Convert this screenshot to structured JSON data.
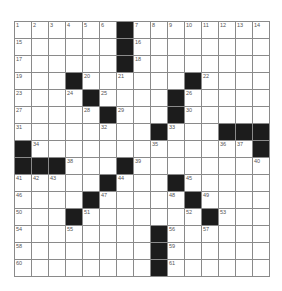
{
  "puzzle": {
    "rows": 15,
    "cols": 15,
    "colors": {
      "black": "#1c1c1c",
      "line": "#8a8a8a",
      "number": "#555555"
    },
    "blacks": [
      [
        0,
        6
      ],
      [
        1,
        6
      ],
      [
        2,
        6
      ],
      [
        3,
        3
      ],
      [
        3,
        10
      ],
      [
        4,
        4
      ],
      [
        4,
        9
      ],
      [
        5,
        5
      ],
      [
        5,
        9
      ],
      [
        6,
        8
      ],
      [
        6,
        12
      ],
      [
        6,
        13
      ],
      [
        6,
        14
      ],
      [
        7,
        0
      ],
      [
        7,
        14
      ],
      [
        8,
        0
      ],
      [
        8,
        1
      ],
      [
        8,
        2
      ],
      [
        8,
        6
      ],
      [
        9,
        5
      ],
      [
        9,
        9
      ],
      [
        10,
        4
      ],
      [
        10,
        10
      ],
      [
        11,
        3
      ],
      [
        11,
        11
      ],
      [
        12,
        8
      ],
      [
        13,
        8
      ],
      [
        14,
        8
      ]
    ],
    "numbers": [
      {
        "r": 0,
        "c": 0,
        "n": "1"
      },
      {
        "r": 0,
        "c": 1,
        "n": "2"
      },
      {
        "r": 0,
        "c": 2,
        "n": "3"
      },
      {
        "r": 0,
        "c": 3,
        "n": "4"
      },
      {
        "r": 0,
        "c": 4,
        "n": "5"
      },
      {
        "r": 0,
        "c": 5,
        "n": "6"
      },
      {
        "r": 0,
        "c": 7,
        "n": "7"
      },
      {
        "r": 0,
        "c": 8,
        "n": "8"
      },
      {
        "r": 0,
        "c": 9,
        "n": "9"
      },
      {
        "r": 0,
        "c": 10,
        "n": "10"
      },
      {
        "r": 0,
        "c": 11,
        "n": "11"
      },
      {
        "r": 0,
        "c": 12,
        "n": "12"
      },
      {
        "r": 0,
        "c": 13,
        "n": "13"
      },
      {
        "r": 0,
        "c": 14,
        "n": "14"
      },
      {
        "r": 1,
        "c": 0,
        "n": "15"
      },
      {
        "r": 1,
        "c": 7,
        "n": "16"
      },
      {
        "r": 2,
        "c": 0,
        "n": "17"
      },
      {
        "r": 2,
        "c": 7,
        "n": "18"
      },
      {
        "r": 3,
        "c": 0,
        "n": "19"
      },
      {
        "r": 3,
        "c": 4,
        "n": "20"
      },
      {
        "r": 3,
        "c": 6,
        "n": "21"
      },
      {
        "r": 3,
        "c": 11,
        "n": "22"
      },
      {
        "r": 4,
        "c": 0,
        "n": "23"
      },
      {
        "r": 4,
        "c": 3,
        "n": "24"
      },
      {
        "r": 4,
        "c": 5,
        "n": "25"
      },
      {
        "r": 4,
        "c": 10,
        "n": "26"
      },
      {
        "r": 5,
        "c": 0,
        "n": "27"
      },
      {
        "r": 5,
        "c": 4,
        "n": "28"
      },
      {
        "r": 5,
        "c": 6,
        "n": "29"
      },
      {
        "r": 5,
        "c": 10,
        "n": "30"
      },
      {
        "r": 6,
        "c": 0,
        "n": "31"
      },
      {
        "r": 6,
        "c": 5,
        "n": "32"
      },
      {
        "r": 6,
        "c": 9,
        "n": "33"
      },
      {
        "r": 7,
        "c": 1,
        "n": "34"
      },
      {
        "r": 7,
        "c": 8,
        "n": "35"
      },
      {
        "r": 7,
        "c": 12,
        "n": "36"
      },
      {
        "r": 7,
        "c": 13,
        "n": "37"
      },
      {
        "r": 8,
        "c": 3,
        "n": "38"
      },
      {
        "r": 8,
        "c": 7,
        "n": "39"
      },
      {
        "r": 8,
        "c": 14,
        "n": "40"
      },
      {
        "r": 9,
        "c": 0,
        "n": "41"
      },
      {
        "r": 9,
        "c": 1,
        "n": "42"
      },
      {
        "r": 9,
        "c": 2,
        "n": "43"
      },
      {
        "r": 9,
        "c": 6,
        "n": "44"
      },
      {
        "r": 9,
        "c": 10,
        "n": "45"
      },
      {
        "r": 10,
        "c": 0,
        "n": "46"
      },
      {
        "r": 10,
        "c": 5,
        "n": "47"
      },
      {
        "r": 10,
        "c": 9,
        "n": "48"
      },
      {
        "r": 10,
        "c": 11,
        "n": "49"
      },
      {
        "r": 11,
        "c": 0,
        "n": "50"
      },
      {
        "r": 11,
        "c": 4,
        "n": "51"
      },
      {
        "r": 11,
        "c": 10,
        "n": "52"
      },
      {
        "r": 11,
        "c": 12,
        "n": "53"
      },
      {
        "r": 12,
        "c": 0,
        "n": "54"
      },
      {
        "r": 12,
        "c": 3,
        "n": "55"
      },
      {
        "r": 12,
        "c": 9,
        "n": "56"
      },
      {
        "r": 12,
        "c": 11,
        "n": "57"
      },
      {
        "r": 13,
        "c": 0,
        "n": "58"
      },
      {
        "r": 13,
        "c": 9,
        "n": "59"
      },
      {
        "r": 14,
        "c": 0,
        "n": "60"
      },
      {
        "r": 14,
        "c": 9,
        "n": "61"
      }
    ]
  }
}
